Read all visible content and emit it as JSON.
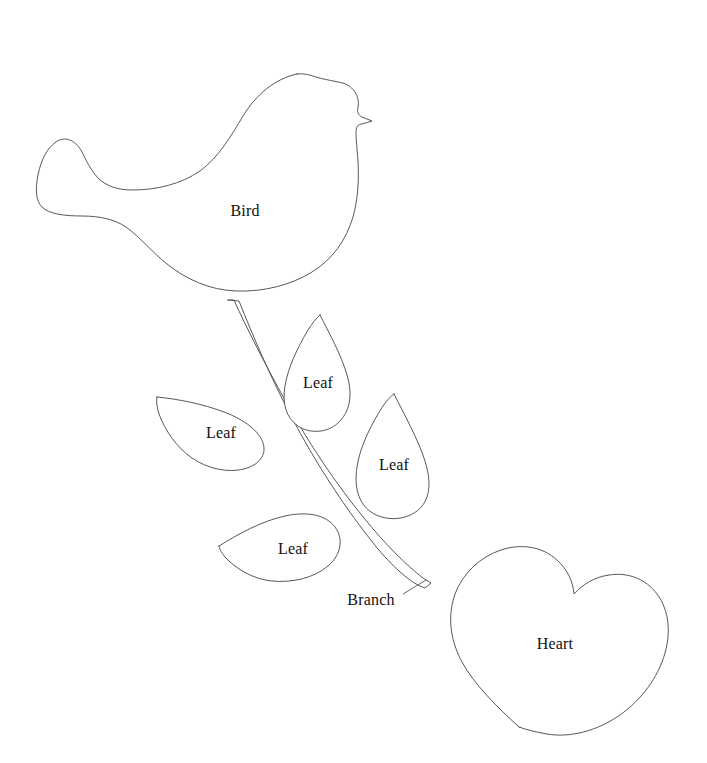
{
  "sheet": {
    "title": "Applique Pattern Template Sheet",
    "background_color": "#ffffff",
    "outline_color": "#58585c",
    "label_color": "#111111",
    "width": 707,
    "height": 763
  },
  "pieces": [
    {
      "id": "bird",
      "label": "Bird",
      "label_x": 245,
      "label_y": 211,
      "icon": "bird-shape-icon",
      "bbox": [
        36,
        72,
        374,
        292
      ]
    },
    {
      "id": "leaf-top",
      "label": "Leaf",
      "label_x": 318,
      "label_y": 383,
      "icon": "leaf-shape-icon",
      "bbox": [
        285,
        314,
        350,
        432
      ]
    },
    {
      "id": "leaf-left",
      "label": "Leaf",
      "label_x": 221,
      "label_y": 433,
      "icon": "leaf-shape-icon",
      "bbox": [
        155,
        396,
        264,
        470
      ]
    },
    {
      "id": "leaf-right",
      "label": "Leaf",
      "label_x": 394,
      "label_y": 465,
      "icon": "leaf-shape-icon",
      "bbox": [
        355,
        393,
        432,
        519
      ]
    },
    {
      "id": "leaf-bottom",
      "label": "Leaf",
      "label_x": 293,
      "label_y": 549,
      "icon": "leaf-shape-icon",
      "bbox": [
        218,
        513,
        340,
        583
      ]
    },
    {
      "id": "branch",
      "label": "Branch",
      "label_x": 371,
      "label_y": 600,
      "icon": "branch-shape-icon",
      "bbox": [
        225,
        299,
        432,
        589
      ]
    },
    {
      "id": "heart",
      "label": "Heart",
      "label_x": 555,
      "label_y": 644,
      "icon": "heart-shape-icon",
      "bbox": [
        450,
        546,
        671,
        729
      ]
    }
  ]
}
